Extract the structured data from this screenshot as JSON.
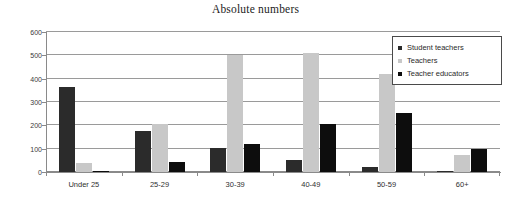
{
  "chart_data": {
    "type": "bar",
    "title": "Absolute numbers",
    "xlabel": "",
    "ylabel": "",
    "ylim": [
      0,
      600
    ],
    "yticks": [
      0,
      100,
      200,
      300,
      400,
      500,
      600
    ],
    "grid": true,
    "legend_position": "top-right",
    "categories": [
      "Under 25",
      "25-29",
      "30-39",
      "40-49",
      "50-59",
      "60+"
    ],
    "series": [
      {
        "name": "Student teachers",
        "color": "#2b2b2b",
        "values": [
          365,
          175,
          102,
          50,
          20,
          2
        ]
      },
      {
        "name": "Teachers",
        "color": "#c8c8c8",
        "values": [
          40,
          205,
          503,
          508,
          418,
          75
        ]
      },
      {
        "name": "Teacher educators",
        "color": "#0d0d0d",
        "values": [
          2,
          42,
          120,
          205,
          252,
          98
        ]
      }
    ]
  },
  "legend": {
    "items": [
      {
        "label": "Student teachers",
        "color": "#2b2b2b"
      },
      {
        "label": "Teachers",
        "color": "#c8c8c8"
      },
      {
        "label": "Teacher educators",
        "color": "#0d0d0d"
      }
    ]
  },
  "axis": {
    "y_tick_labels": [
      "600",
      "500",
      "400",
      "300",
      "200",
      "100",
      "0"
    ],
    "x_tick_labels": [
      "Under 25",
      "25-29",
      "30-39",
      "40-49",
      "50-59",
      "60+"
    ]
  }
}
